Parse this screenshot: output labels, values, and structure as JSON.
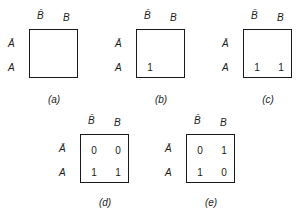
{
  "col_labels": [
    "B̄",
    "B"
  ],
  "row_labels": [
    "Ā",
    "A"
  ],
  "maps": [
    {
      "caption": "(a)",
      "cells": {
        "nA_nB": "",
        "nA_B": "",
        "A_nB": "",
        "A_B": ""
      }
    },
    {
      "caption": "(b)",
      "cells": {
        "nA_nB": "",
        "nA_B": "",
        "A_nB": "1",
        "A_B": ""
      }
    },
    {
      "caption": "(c)",
      "cells": {
        "nA_nB": "",
        "nA_B": "",
        "A_nB": "1",
        "A_B": "1"
      }
    },
    {
      "caption": "(d)",
      "cells": {
        "nA_nB": "0",
        "nA_B": "0",
        "A_nB": "1",
        "A_B": "1"
      }
    },
    {
      "caption": "(e)",
      "cells": {
        "nA_nB": "0",
        "nA_B": "1",
        "A_nB": "1",
        "A_B": "0"
      }
    }
  ]
}
